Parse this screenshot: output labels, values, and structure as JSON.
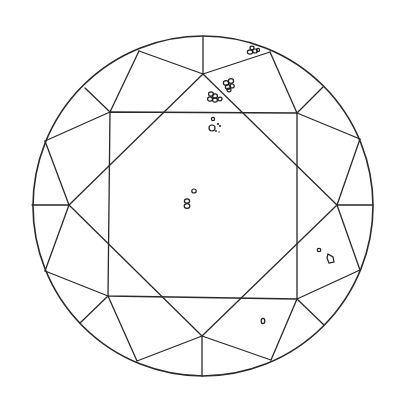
{
  "diagram": {
    "type": "diamond-plot",
    "cut": "round brilliant (crown view)",
    "colors": {
      "line": "#2a2a2a",
      "background": "#ffffff",
      "inclusion": "#1e1e1e"
    },
    "girdle": {
      "cx": 203,
      "cy": 206,
      "r": 170
    },
    "table": [
      [
        110,
        112
      ],
      [
        297,
        113
      ],
      [
        297,
        299
      ],
      [
        108,
        296
      ]
    ],
    "star_points": {
      "top": [
        203,
        74
      ],
      "right": [
        337,
        205
      ],
      "bottom": [
        202,
        336
      ],
      "left": [
        69,
        205
      ]
    },
    "girdle_points": {
      "top": [
        203,
        37
      ],
      "top_right": [
        270,
        52
      ],
      "upper_right": [
        360,
        139
      ],
      "right": [
        373,
        205
      ],
      "lower_right": [
        360,
        270
      ],
      "bottom_right": [
        271,
        360
      ],
      "bottom": [
        202,
        376
      ],
      "bottom_left": [
        137,
        361
      ],
      "lower_left": [
        45,
        271
      ],
      "left": [
        32,
        205
      ],
      "upper_left": [
        45,
        141
      ],
      "top_left": [
        139,
        51
      ]
    },
    "inclusions": [
      {
        "name": "cluster-top-girdle",
        "x": 252,
        "y": 50,
        "desc": "small crystal cluster near girdle edge"
      },
      {
        "name": "cluster-star-upper",
        "x": 229,
        "y": 84,
        "desc": "group of pinpoint crystals"
      },
      {
        "name": "cluster-star-lower",
        "x": 213,
        "y": 97,
        "desc": "group of pinpoint crystals"
      },
      {
        "name": "cluster-table-top",
        "x": 212,
        "y": 125,
        "desc": "crystal with pinpoints"
      },
      {
        "name": "pair-center",
        "x": 190,
        "y": 200,
        "desc": "two small crystals near center"
      },
      {
        "name": "pair-right",
        "x": 325,
        "y": 255,
        "desc": "pinpoint and feather-shaped crystal"
      },
      {
        "name": "single-lower-right",
        "x": 263,
        "y": 321,
        "desc": "single crystal"
      }
    ]
  }
}
